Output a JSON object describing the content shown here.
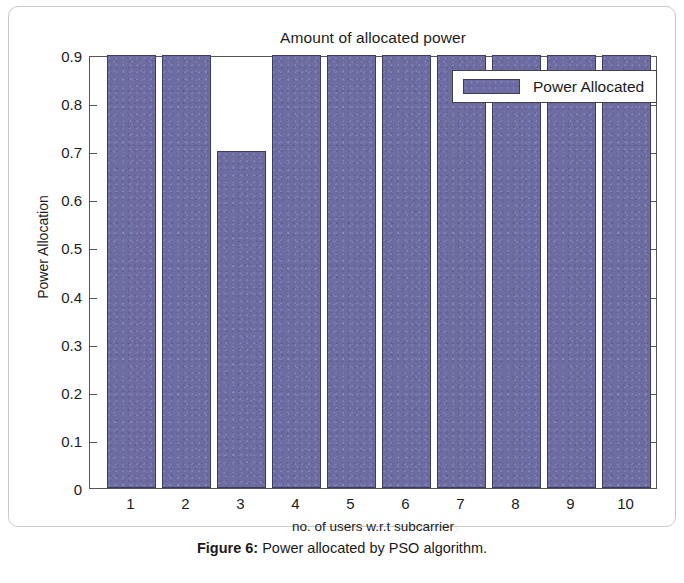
{
  "figure": {
    "caption_label": "Figure 6:",
    "caption_text": " Power allocated by PSO algorithm."
  },
  "chart_data": {
    "type": "bar",
    "title": "Amount of allocated power",
    "xlabel": "no. of users w.r.t subcarrier",
    "ylabel": "Power Allocation",
    "categories": [
      "1",
      "2",
      "3",
      "4",
      "5",
      "6",
      "7",
      "8",
      "9",
      "10"
    ],
    "values": [
      0.9,
      0.9,
      0.7,
      0.9,
      0.9,
      0.9,
      0.9,
      0.9,
      0.9,
      0.9
    ],
    "series": [
      {
        "name": "Power Allocated",
        "values": [
          0.9,
          0.9,
          0.7,
          0.9,
          0.9,
          0.9,
          0.9,
          0.9,
          0.9,
          0.9
        ],
        "color": "#6d6da4"
      }
    ],
    "ylim": [
      0,
      0.9
    ],
    "ytick_labels": [
      "0.9",
      "0.8",
      "0.7",
      "0.6",
      "0.5",
      "0.4",
      "0.3",
      "0.2",
      "0.1",
      "0"
    ],
    "ytick_values": [
      0.9,
      0.8,
      0.7,
      0.6,
      0.5,
      0.4,
      0.3,
      0.2,
      0.1,
      0
    ],
    "grid": false,
    "legend": {
      "position": "top-right",
      "entries": [
        "Power Allocated"
      ]
    },
    "bar_color": "#6d6da4",
    "bar_edge_color": "#3c3c63",
    "axis_color": "#555555",
    "background": "#ffffff"
  }
}
